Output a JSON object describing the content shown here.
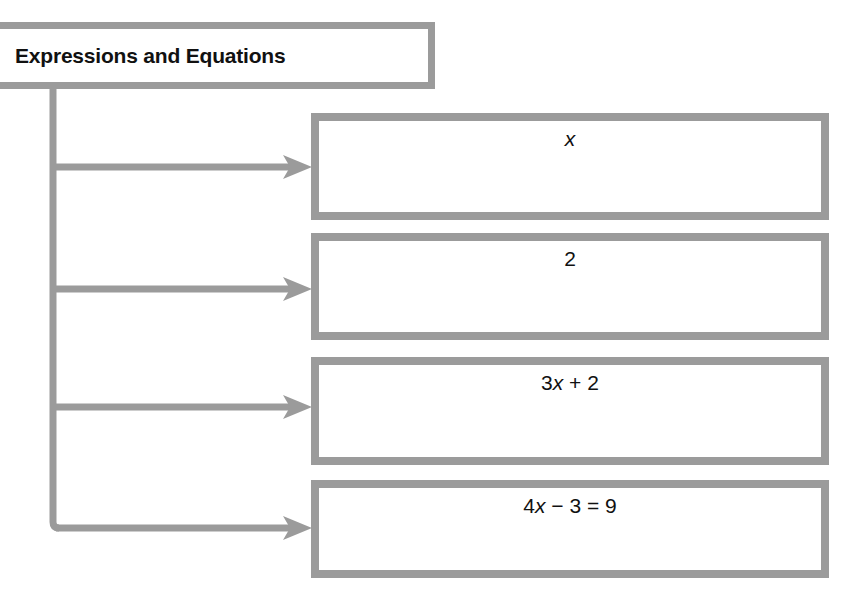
{
  "diagram": {
    "title": "Expressions and Equations",
    "colors": {
      "border_gray": "#9b9b9b",
      "connector_gray": "#9b9b9b",
      "text_black": "#111111",
      "background": "#ffffff"
    },
    "root": {
      "label": "Expressions and Equations"
    },
    "nodes": [
      {
        "id": "node-1",
        "label": "x",
        "kind": "variable"
      },
      {
        "id": "node-2",
        "label": "2",
        "kind": "constant"
      },
      {
        "id": "node-3",
        "label": "3x + 2",
        "kind": "expression"
      },
      {
        "id": "node-4",
        "label": "4x − 3 = 9",
        "kind": "equation"
      }
    ],
    "connectors": [
      {
        "from": "root",
        "to": "node-1",
        "type": "arrow"
      },
      {
        "from": "root",
        "to": "node-2",
        "type": "arrow"
      },
      {
        "from": "root",
        "to": "node-3",
        "type": "arrow"
      },
      {
        "from": "root",
        "to": "node-4",
        "type": "arrow"
      }
    ]
  },
  "chart_data": {
    "type": "diagram",
    "title": "Expressions and Equations",
    "layout": "tree-left-root-vertical-trunk",
    "root_label": "Expressions and Equations",
    "children": [
      "x",
      "2",
      "3x + 2",
      "4x − 3 = 9"
    ]
  }
}
